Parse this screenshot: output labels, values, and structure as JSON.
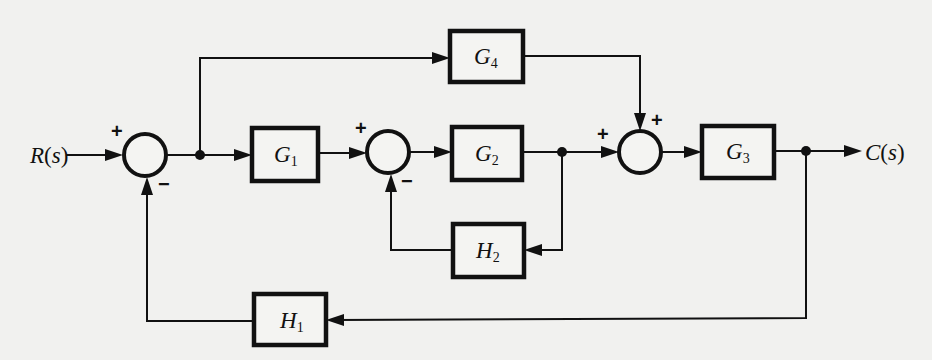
{
  "diagram": {
    "signals": {
      "input": {
        "name": "R",
        "arg": "s"
      },
      "output": {
        "name": "C",
        "arg": "s"
      }
    },
    "blocks": {
      "G1": {
        "name": "G",
        "sub": "1"
      },
      "G2": {
        "name": "G",
        "sub": "2"
      },
      "G3": {
        "name": "G",
        "sub": "3"
      },
      "G4": {
        "name": "G",
        "sub": "4"
      },
      "H1": {
        "name": "H",
        "sub": "1"
      },
      "H2": {
        "name": "H",
        "sub": "2"
      }
    },
    "summing_junctions": {
      "S1": {
        "top_sign": "+",
        "bottom_sign": "−"
      },
      "S2": {
        "top_sign": "+",
        "bottom_sign": "−"
      },
      "S3": {
        "left_sign": "+",
        "top_sign": "+"
      }
    },
    "connections": [
      "R(s) → S1 (+)",
      "S1 → takeoff A",
      "takeoff A → G1",
      "takeoff A → G4",
      "G1 → S2 (+)",
      "S2 → G2",
      "G2 → takeoff B",
      "takeoff B → S3 (+)",
      "takeoff B → H2",
      "H2 → S2 (−)",
      "G4 → S3 (+)",
      "S3 → G3",
      "G3 → takeoff C",
      "takeoff C → C(s)",
      "takeoff C → H1",
      "H1 → S1 (−)"
    ]
  }
}
